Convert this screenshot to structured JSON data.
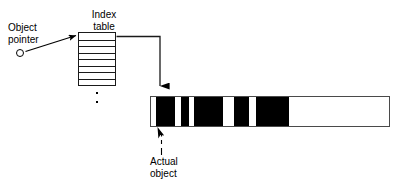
{
  "diagram": {
    "labels": {
      "object_pointer": "Object\npointer",
      "index_table": "Index\ntable",
      "actual_object": "Actual\nobject"
    },
    "index_table": {
      "rows": 8,
      "row_divider_count": 7,
      "fill": "#ffffff",
      "stroke": "#1a1a1a",
      "continuation_dots": 2
    },
    "object_bar": {
      "stroke": "#4a4a4a",
      "fill": "#ffffff",
      "segment_color": "#000000",
      "segments": [
        {
          "left": 5,
          "width": 19
        },
        {
          "left": 30,
          "width": 8
        },
        {
          "left": 43,
          "width": 29
        },
        {
          "left": 83,
          "width": 15
        },
        {
          "left": 105,
          "width": 33
        }
      ],
      "total_width": 240,
      "used_width": 138
    },
    "connectors": {
      "pointer_arrow": "circle to index table first row, diagonal up-right",
      "table_to_object": "right side of first row, right then down to object bar",
      "object_callout": "dotted leader from label up to arrowhead on object bar"
    },
    "colors": {
      "ink": "#000000",
      "line": "#1a1a1a",
      "bar_border": "#4a4a4a",
      "background": "#ffffff"
    }
  }
}
